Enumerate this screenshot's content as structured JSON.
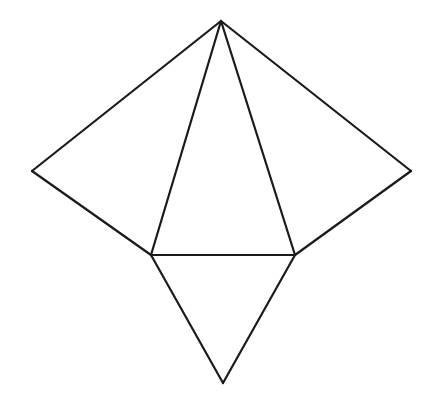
{
  "diagram": {
    "type": "pyramid-net",
    "stroke_color": "#1a1a1a",
    "background": "#ffffff",
    "vertices": {
      "apex": [
        221,
        21
      ],
      "left": [
        32,
        171
      ],
      "right": [
        411,
        171
      ],
      "base_left": [
        151,
        255
      ],
      "base_right": [
        295,
        255
      ],
      "bottom": [
        223,
        383
      ]
    },
    "edges": [
      [
        "apex",
        "left"
      ],
      [
        "left",
        "base_left"
      ],
      [
        "apex",
        "base_left"
      ],
      [
        "apex",
        "base_right"
      ],
      [
        "base_left",
        "base_right"
      ],
      [
        "apex",
        "right"
      ],
      [
        "right",
        "base_right"
      ],
      [
        "base_left",
        "bottom"
      ],
      [
        "base_right",
        "bottom"
      ]
    ]
  }
}
